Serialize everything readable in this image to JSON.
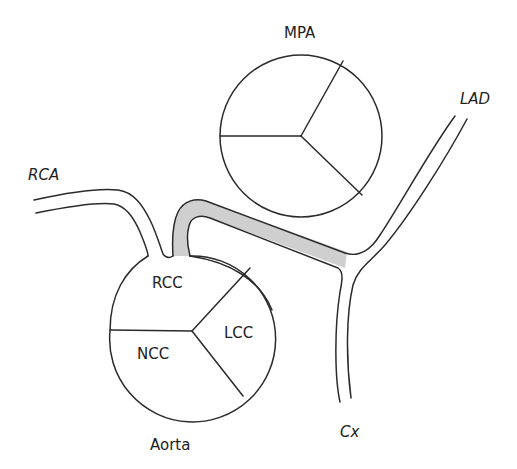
{
  "diagram": {
    "type": "anatomical-schematic",
    "colors": {
      "line": "#2a2a2a",
      "highlight_fill": "#cfcfcf",
      "background": "#ffffff"
    },
    "labels": {
      "mpa": "MPA",
      "rca": "RCA",
      "lad": "LAD",
      "rcc": "RCC",
      "lcc": "LCC",
      "ncc": "NCC",
      "aorta": "Aorta",
      "cx": "Cx"
    },
    "structures": [
      {
        "id": "mpa",
        "name": "Main pulmonary artery",
        "shape": "circle divided into 3 cusps"
      },
      {
        "id": "aorta",
        "name": "Aorta",
        "shape": "circle divided into 3 cusps",
        "cusps": [
          "RCC",
          "LCC",
          "NCC"
        ]
      },
      {
        "id": "rca",
        "name": "Right coronary artery",
        "origin": "RCC"
      },
      {
        "id": "left-main",
        "name": "Anomalous left coronary course (shaded)",
        "origin": "RCC",
        "course": "between aorta and MPA",
        "branches": [
          "LAD",
          "Cx"
        ]
      }
    ]
  }
}
